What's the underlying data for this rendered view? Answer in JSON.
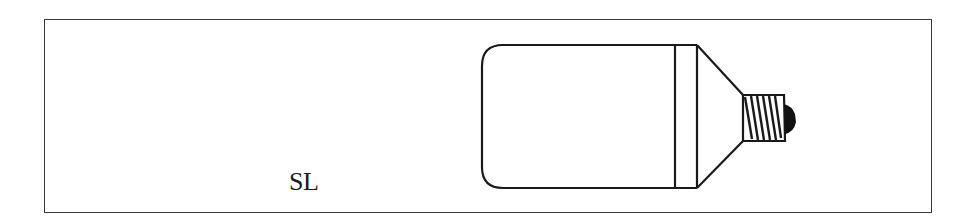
{
  "diagram": {
    "label": "SL",
    "colors": {
      "stroke": "#1a1a1a",
      "frame": "#3a3a3a",
      "background": "#ffffff",
      "tip": "#111111"
    }
  }
}
